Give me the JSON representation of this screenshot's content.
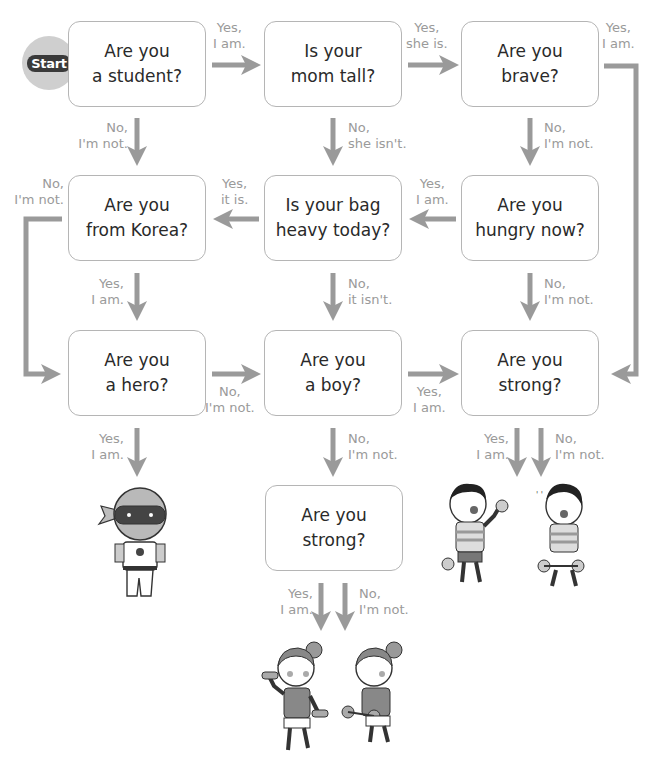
{
  "start_label": "Start",
  "nodes": {
    "student": {
      "line1": "Are you",
      "line2": "a student?"
    },
    "mom_tall": {
      "line1": "Is your",
      "line2": "mom tall?"
    },
    "brave": {
      "line1": "Are you",
      "line2": "brave?"
    },
    "korea": {
      "line1": "Are you",
      "line2": "from Korea?"
    },
    "bag_heavy": {
      "line1": "Is your bag",
      "line2": "heavy today?"
    },
    "hungry": {
      "line1": "Are you",
      "line2": "hungry now?"
    },
    "hero": {
      "line1": "Are you",
      "line2": "a hero?"
    },
    "boy": {
      "line1": "Are you",
      "line2": "a boy?"
    },
    "strong_right": {
      "line1": "Are you",
      "line2": "strong?"
    },
    "strong_bottom": {
      "line1": "Are you",
      "line2": "strong?"
    }
  },
  "edges": {
    "student_yes": {
      "line1": "Yes,",
      "line2": "I am."
    },
    "student_no": {
      "line1": "No,",
      "line2": "I'm not."
    },
    "mom_yes": {
      "line1": "Yes,",
      "line2": "she is."
    },
    "mom_no": {
      "line1": "No,",
      "line2": "she isn't."
    },
    "brave_yes": {
      "line1": "Yes,",
      "line2": "I am."
    },
    "brave_no": {
      "line1": "No,",
      "line2": "I'm not."
    },
    "korea_no": {
      "line1": "No,",
      "line2": "I'm not."
    },
    "korea_yes": {
      "line1": "Yes,",
      "line2": "I am."
    },
    "bag_yes": {
      "line1": "Yes,",
      "line2": "it is."
    },
    "bag_no": {
      "line1": "No,",
      "line2": "it isn't."
    },
    "hungry_yes": {
      "line1": "Yes,",
      "line2": "I am."
    },
    "hungry_no": {
      "line1": "No,",
      "line2": "I'm not."
    },
    "hero_no": {
      "line1": "No,",
      "line2": "I'm not."
    },
    "hero_yes": {
      "line1": "Yes,",
      "line2": "I am."
    },
    "boy_yes": {
      "line1": "Yes,",
      "line2": "I am."
    },
    "boy_no": {
      "line1": "No,",
      "line2": "I'm not."
    },
    "strong_right_yes": {
      "line1": "Yes,",
      "line2": "I am."
    },
    "strong_right_no": {
      "line1": "No,",
      "line2": "I'm not."
    },
    "strong_bottom_yes": {
      "line1": "Yes,",
      "line2": "I am."
    },
    "strong_bottom_no": {
      "line1": "No,",
      "line2": "I'm not."
    }
  },
  "results": {
    "hero": "hero-character-illustration",
    "strong_boy": "strong-boy-lifting-dumbbells",
    "weak_boy": "tired-boy-lifting-dumbbells",
    "strong_girl": "strong-girl-lifting-dumbbells",
    "weak_girl": "tired-girl-lifting-dumbbells"
  },
  "colors": {
    "arrow": "#9a9a9a",
    "box_border": "#b5b5b5",
    "label": "#9a9a9a",
    "text": "#2a2a2a",
    "start_circle": "#cfcfcf"
  }
}
